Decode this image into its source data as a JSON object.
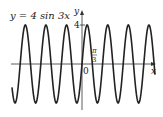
{
  "chart_data": {
    "type": "line",
    "title": "y = 4 sin 3x",
    "xlabel": "x",
    "ylabel": "y",
    "function": "4*sin(3*x)",
    "amplitude": 4,
    "period": "2π/3",
    "annotations": [
      "4",
      "π/3",
      "0"
    ],
    "ytick_labels": [
      "4"
    ],
    "xtick_labels": [
      "π/3"
    ],
    "origin_label": "0",
    "xlim_approx": [
      -7.2,
      7.5
    ],
    "ylim": [
      -4,
      4
    ],
    "grid": false,
    "series": [
      {
        "name": "y = 4 sin 3x",
        "color": "#222222"
      }
    ]
  },
  "labels": {
    "equation": "y = 4 sin 3x",
    "x_axis": "x",
    "y_axis": "y",
    "y_tick": "4",
    "origin": "0",
    "pi": "π",
    "three": "3"
  }
}
